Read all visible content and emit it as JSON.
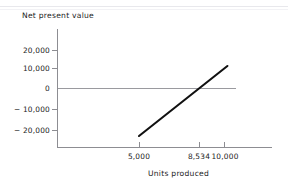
{
  "chart_data": {
    "type": "line",
    "title": "",
    "xlabel": "Units produced",
    "ylabel": "Net present value",
    "xlim": [
      3200,
      11200
    ],
    "ylim": [
      -28000,
      26000
    ],
    "grid": false,
    "legend": null,
    "zero_line": 0,
    "x_ticks": [
      {
        "value": 5000,
        "label": "5,000"
      },
      {
        "value": 8534,
        "label": "8,534"
      },
      {
        "value": 10000,
        "label": "10,000"
      }
    ],
    "y_ticks": [
      {
        "value": 20000,
        "label": "20,000"
      },
      {
        "value": 10000,
        "label": "10,000"
      },
      {
        "value": 0,
        "label": "0"
      },
      {
        "value": -10000,
        "label": "− 10,000"
      },
      {
        "value": -20000,
        "label": "− 20,000"
      }
    ],
    "series": [
      {
        "name": "Net present value",
        "color": "#111111",
        "x": [
          5000,
          8534,
          10200
        ],
        "values": [
          -23000,
          0,
          12000
        ]
      }
    ],
    "annotations": [
      {
        "name": "breakeven",
        "x": 8534,
        "y": 0,
        "text": "8,534"
      }
    ]
  },
  "axis_titles": {
    "y": "Net present value",
    "x": "Units produced"
  },
  "colors": {
    "axis": "#8d8d92",
    "zero_line": "#9a9a9f",
    "data_line": "#111111",
    "text": "#1c1c1c",
    "background": "#ffffff",
    "top_rule": "#e8e8ec"
  }
}
